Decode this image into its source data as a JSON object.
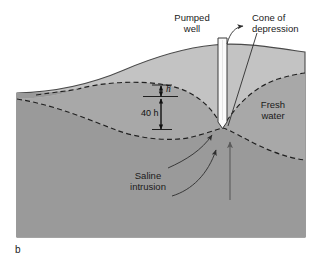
{
  "figure": {
    "panel_label": "b",
    "type": "cross-section-diagram"
  },
  "colors": {
    "background": "#ffffff",
    "upper_zone_fill": "#c3c3c3",
    "saline_body_fill": "#9a9a9a",
    "fresh_lens_fill": "#a8a8a8",
    "well_fill": "#fbfbfb",
    "outline": "#4a4a4a",
    "dash_interface": "#1f1f1f",
    "leader_line": "#2e2e2e",
    "flow_arrow": "#5a5a5a",
    "text": "#1a1a1a"
  },
  "labels": {
    "pumped_well": {
      "line1": "Pumped",
      "line2": "well"
    },
    "cone_of_depression": {
      "line1": "Cone of",
      "line2": "depression"
    },
    "fresh_water": {
      "line1": "Fresh",
      "line2": "water"
    },
    "saline_intrusion": {
      "line1": "Saline",
      "line2": "intrusion"
    },
    "head_symbol": "h",
    "depth_dimension": "40 h"
  },
  "annotations": {
    "head_meaning": "h = freshwater head above sea level",
    "depth_meaning": "40 h = depth of fresh/saline interface below sea level",
    "ghyben_herzberg_ratio": 40
  },
  "geometry": {
    "body_left": 17,
    "body_right": 305,
    "body_bottom": 237,
    "well_left": 218,
    "well_right": 227,
    "well_top": 38,
    "well_bottom": 128,
    "sea_level_y": 93
  }
}
